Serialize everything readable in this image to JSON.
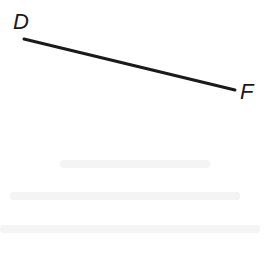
{
  "diagram": {
    "type": "line-segment",
    "segment": {
      "name": "DF",
      "stroke_color": "#1a1a1a",
      "stroke_width": 3,
      "start": {
        "x": 24,
        "y": 39
      },
      "end": {
        "x": 235,
        "y": 90
      }
    },
    "points": [
      {
        "label": "D",
        "x": 24,
        "y": 39
      },
      {
        "label": "F",
        "x": 235,
        "y": 90
      }
    ]
  }
}
